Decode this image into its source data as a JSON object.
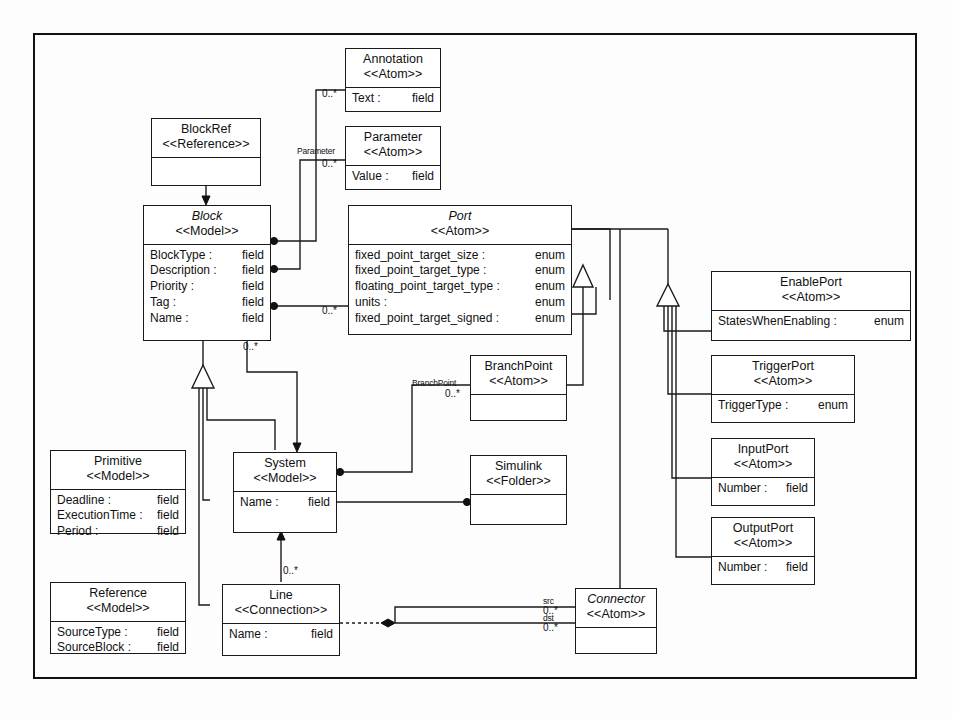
{
  "diagram": {
    "caption": "",
    "accent_color": "#1a1a1a",
    "background_color": "#ffffff"
  },
  "classes": {
    "blockref": {
      "name": "BlockRef",
      "stereotype": "<<Reference>>",
      "attributes": []
    },
    "block": {
      "name": "Block",
      "stereotype": "<<Model>>",
      "attributes": [
        {
          "key": "BlockType :",
          "value": "field"
        },
        {
          "key": "Description :",
          "value": "field"
        },
        {
          "key": "Priority :",
          "value": "field"
        },
        {
          "key": "Tag :",
          "value": "field"
        },
        {
          "key": "Name :",
          "value": "field"
        }
      ]
    },
    "annotation": {
      "name": "Annotation",
      "stereotype": "<<Atom>>",
      "attributes": [
        {
          "key": "Text :",
          "value": "field"
        }
      ]
    },
    "parameter": {
      "name": "Parameter",
      "stereotype": "<<Atom>>",
      "attributes": [
        {
          "key": "Value :",
          "value": "field"
        }
      ]
    },
    "port": {
      "name": "Port",
      "stereotype": "<<Atom>>",
      "attributes": [
        {
          "key": "fixed_point_target_size :",
          "value": "enum"
        },
        {
          "key": "fixed_point_target_type :",
          "value": "enum"
        },
        {
          "key": "floating_point_target_type :",
          "value": "enum"
        },
        {
          "key": "units :",
          "value": "enum"
        },
        {
          "key": "fixed_point_target_signed :",
          "value": "enum"
        }
      ]
    },
    "enableport": {
      "name": "EnablePort",
      "stereotype": "<<Atom>>",
      "attributes": [
        {
          "key": "StatesWhenEnabling :",
          "value": "enum"
        }
      ]
    },
    "triggerport": {
      "name": "TriggerPort",
      "stereotype": "<<Atom>>",
      "attributes": [
        {
          "key": "TriggerType :",
          "value": "enum"
        }
      ]
    },
    "inputport": {
      "name": "InputPort",
      "stereotype": "<<Atom>>",
      "attributes": [
        {
          "key": "Number :",
          "value": "field"
        }
      ]
    },
    "outputport": {
      "name": "OutputPort",
      "stereotype": "<<Atom>>",
      "attributes": [
        {
          "key": "Number :",
          "value": "field"
        }
      ]
    },
    "branchpoint": {
      "name": "BranchPoint",
      "stereotype": "<<Atom>>",
      "attributes": []
    },
    "primitive": {
      "name": "Primitive",
      "stereotype": "<<Model>>",
      "attributes": [
        {
          "key": "Deadline :",
          "value": "field"
        },
        {
          "key": "ExecutionTime :",
          "value": "field"
        },
        {
          "key": "Period :",
          "value": "field"
        }
      ]
    },
    "reference": {
      "name": "Reference",
      "stereotype": "<<Model>>",
      "attributes": [
        {
          "key": "SourceType :",
          "value": "field"
        },
        {
          "key": "SourceBlock :",
          "value": "field"
        }
      ]
    },
    "system": {
      "name": "System",
      "stereotype": "<<Model>>",
      "attributes": [
        {
          "key": "Name :",
          "value": "field"
        }
      ]
    },
    "simulink": {
      "name": "Simulink",
      "stereotype": "<<Folder>>",
      "attributes": []
    },
    "line": {
      "name": "Line",
      "stereotype": "<<Connection>>",
      "attributes": [
        {
          "key": "Name :",
          "value": "field"
        }
      ]
    },
    "connector": {
      "name": "Connector",
      "stereotype": "<<Atom>>",
      "attributes": []
    }
  },
  "edge_labels": {
    "parameter_role": "Parameter",
    "branchpoint_role": "BranchPoint",
    "src_role": "src",
    "dst_role": "dst"
  },
  "multiplicities": {
    "annotation": "0..*",
    "parameter": "0..*",
    "port": "0..*",
    "block_system": "0..*",
    "branchpoint": "0..*",
    "line": "0..*",
    "connector_src": "0..*",
    "connector_dst": "0..*"
  }
}
